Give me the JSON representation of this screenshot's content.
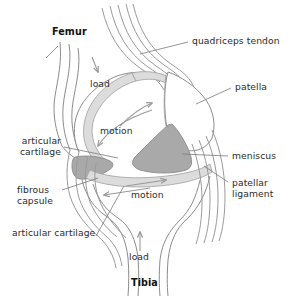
{
  "figure": {
    "width": 290,
    "height": 304,
    "background": "#ffffff"
  },
  "colors": {
    "outline": "#8c8c8c",
    "outline_dark": "#6e6e6e",
    "bone_fill": "#ffffff",
    "cartilage_fill": "#dcdcdc",
    "meniscus_fill": "#a9a9a9",
    "arrow": "#9a9a9a",
    "leader": "#7a7a7a",
    "text": "#2b2b2b",
    "text_bold": "#121212"
  },
  "labels": {
    "femur": "Femur",
    "tibia": "Tibia",
    "quadriceps_tendon": "quadriceps tendon",
    "patella": "patella",
    "meniscus": "meniscus",
    "patellar_ligament_line1": "patellar",
    "patellar_ligament_line2": "ligament",
    "articular_cartilage_line1": "articular",
    "articular_cartilage_line2": "cartilage",
    "fibrous_capsule_line1": "fibrous",
    "fibrous_capsule_line2": "capsule",
    "articular_cartilage_lower": "articular cartilage",
    "load_upper": "load",
    "load_lower": "load",
    "motion_upper": "motion",
    "motion_lower": "motion"
  },
  "structures": [
    {
      "name": "femur",
      "kind": "bone",
      "label": "Femur",
      "fill": "#ffffff"
    },
    {
      "name": "tibia",
      "kind": "bone",
      "label": "Tibia",
      "fill": "#ffffff"
    },
    {
      "name": "patella",
      "kind": "bone",
      "label": "patella",
      "fill": "#ffffff"
    },
    {
      "name": "quadriceps-tendon",
      "kind": "tendon",
      "label": "quadriceps tendon",
      "fill": "#ffffff"
    },
    {
      "name": "patellar-ligament",
      "kind": "ligament",
      "label": "patellar ligament",
      "fill": "#ffffff"
    },
    {
      "name": "meniscus-anterior",
      "kind": "fibrocartilage",
      "label": "meniscus",
      "fill": "#a9a9a9"
    },
    {
      "name": "meniscus-posterior",
      "kind": "fibrocartilage",
      "label": "meniscus",
      "fill": "#a9a9a9"
    },
    {
      "name": "articular-cartilage-femoral",
      "kind": "cartilage",
      "label": "articular cartilage",
      "fill": "#dcdcdc"
    },
    {
      "name": "articular-cartilage-tibial",
      "kind": "cartilage",
      "label": "articular cartilage",
      "fill": "#dcdcdc"
    },
    {
      "name": "fibrous-capsule",
      "kind": "capsule",
      "label": "fibrous capsule",
      "fill": "none"
    }
  ],
  "annotations": {
    "load_arrows": [
      {
        "name": "load-arrow-femur",
        "label": "load",
        "direction": "down"
      },
      {
        "name": "load-arrow-tibia",
        "label": "load",
        "direction": "up"
      }
    ],
    "motion_arrows": [
      {
        "name": "motion-arrow-femoral",
        "label": "motion",
        "direction": "bidirectional"
      },
      {
        "name": "motion-arrow-tibial",
        "label": "motion",
        "direction": "bidirectional"
      }
    ]
  }
}
